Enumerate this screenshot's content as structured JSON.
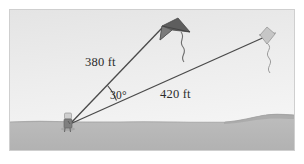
{
  "figure": {
    "labels": {
      "side_left": "380 ft",
      "side_right": "420 ft",
      "angle": "30°"
    },
    "colors": {
      "sky_top": "#e6e6e6",
      "sky_bottom": "#f4f4f4",
      "ground": "#b8b8b8",
      "ground_shadow": "#a9a9a9",
      "line": "#4a4a4a",
      "text": "#2b2b2b",
      "kite_large": "#5a5a5a",
      "kite_small": "#9a9a9a",
      "frame_border": "#cfcfcf",
      "person": "#8d8d8d"
    },
    "geometry": {
      "vertex_label": "observer",
      "vertex_x": 60,
      "vertex_y": 114,
      "kite_large_x": 155,
      "kite_large_y": 14,
      "kite_small_x": 259,
      "kite_small_y": 24,
      "horizon_y": 119
    },
    "elements": {
      "kite_large_name": "large-kite",
      "kite_small_name": "small-kite",
      "person_name": "observer-figure",
      "ground_name": "ground-band",
      "sky_name": "sky-background",
      "line_left_name": "string-380",
      "line_right_name": "string-420",
      "angle_arc_name": "angle-arc"
    }
  }
}
